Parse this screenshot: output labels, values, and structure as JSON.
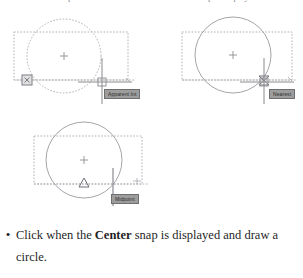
{
  "page": {
    "background_color": "#ffffff",
    "top_cut_row": {
      "left_fragment": "snap",
      "right_fragment": "snap is displayed"
    }
  },
  "figures": [
    {
      "id": "apparent-int",
      "name": "figure-apparent-int",
      "caption_tooltip": "Apparent Int",
      "circle_style": "dashed",
      "rectangle_style": "dashed",
      "center_marker": "cross",
      "snap_marker": "square-x",
      "snap_marker_label": "apparent-intersection-marker",
      "cursor": "crosshair",
      "line_color": "#a8a8ad",
      "tooltip_bg": "#9d9d9d",
      "tooltip_border": "#6f6f6f",
      "tooltip_text_color": "#2b2b2b"
    },
    {
      "id": "nearest",
      "name": "figure-nearest",
      "caption_tooltip": "Nearest",
      "circle_style": "solid",
      "rectangle_style": "dashed",
      "center_marker": "cross",
      "snap_marker": "hourglass",
      "snap_marker_label": "nearest-marker",
      "cursor": "crosshair",
      "line_color": "#a8a8ad",
      "tooltip_bg": "#9d9d9d",
      "tooltip_border": "#6f6f6f",
      "tooltip_text_color": "#2b2b2b"
    },
    {
      "id": "midpoint",
      "name": "figure-midpoint",
      "caption_tooltip": "Midpoint",
      "circle_style": "solid",
      "rectangle_style": "dashed",
      "center_marker": "cross",
      "snap_marker": "triangle",
      "snap_marker_label": "midpoint-marker",
      "cursor": "vertical-bar",
      "line_color": "#a8a8ad",
      "tooltip_bg": "#9d9d9d",
      "tooltip_border": "#6f6f6f",
      "tooltip_text_color": "#2b2b2b"
    }
  ],
  "instruction": {
    "bullet": "•",
    "text_before": "Click when the ",
    "emphasis": "Center",
    "text_after": " snap is displayed and draw a circle."
  }
}
